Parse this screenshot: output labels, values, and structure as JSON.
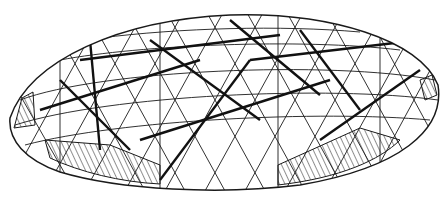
{
  "figure": {
    "background": "#ffffff",
    "stroke": "#1a1a1a",
    "hatched_panels": 4
  }
}
